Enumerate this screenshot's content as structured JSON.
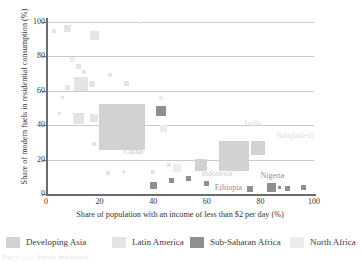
{
  "chart_data": {
    "type": "scatter",
    "title": "",
    "xlabel": "Share of population with an income of less than $2 per day (%)",
    "ylabel": "Share of modern fuels in residential consumption (%)",
    "xlim": [
      0,
      100
    ],
    "ylim": [
      0,
      100
    ],
    "xticks": [
      "0",
      "20",
      "40",
      "60",
      "80",
      "100"
    ],
    "yticks": [
      "0",
      "20",
      "40",
      "60",
      "80",
      "100"
    ],
    "grid": "horizontal",
    "legend_position": "bottom",
    "legend": [
      {
        "name": "Developing Asia",
        "color": "#d2d2d2"
      },
      {
        "name": "Latin America",
        "color": "#e4e4e4"
      },
      {
        "name": "Sub-Saharan Africa",
        "color": "#8f8f8f"
      },
      {
        "name": "North Africa",
        "color": "#ececec"
      }
    ],
    "annotations": [
      {
        "text": "China",
        "x": 29,
        "y": 24,
        "color": "#c8c8c8"
      },
      {
        "text": "India",
        "x": 74,
        "y": 40,
        "color": "#d8d8d8"
      },
      {
        "text": "Bangladesh",
        "x": 86,
        "y": 33,
        "color": "#e0e0e0"
      },
      {
        "text": "Indonesia",
        "x": 58,
        "y": 11,
        "color": "#cdcdcd"
      },
      {
        "text": "Nigeria",
        "x": 80,
        "y": 10,
        "color": "#8f8f8f"
      },
      {
        "text": "Ethiopia",
        "x": 63,
        "y": 3,
        "color": "#8f8f8f"
      }
    ],
    "points": [
      {
        "series": "Developing Asia",
        "x": 28.5,
        "y": 39,
        "size": 46,
        "label": "China"
      },
      {
        "series": "Developing Asia",
        "x": 70,
        "y": 22,
        "size": 30,
        "label": "India"
      },
      {
        "series": "Developing Asia",
        "x": 79,
        "y": 27,
        "size": 14,
        "label": "Bangladesh"
      },
      {
        "series": "Developing Asia",
        "x": 58,
        "y": 17,
        "size": 12,
        "label": "Indonesia"
      },
      {
        "series": "Sub-Saharan Africa",
        "x": 84,
        "y": 4,
        "size": 9,
        "label": "Nigeria"
      },
      {
        "series": "Sub-Saharan Africa",
        "x": 76,
        "y": 3,
        "size": 6,
        "label": "Ethiopia"
      },
      {
        "series": "Sub-Saharan Africa",
        "x": 43,
        "y": 48,
        "size": 10,
        "label": "South Africa"
      },
      {
        "series": "Sub-Saharan Africa",
        "x": 40,
        "y": 5,
        "size": 7,
        "label": ""
      },
      {
        "series": "Sub-Saharan Africa",
        "x": 47,
        "y": 8,
        "size": 5,
        "label": ""
      },
      {
        "series": "Sub-Saharan Africa",
        "x": 53,
        "y": 9,
        "size": 5,
        "label": ""
      },
      {
        "series": "Sub-Saharan Africa",
        "x": 60,
        "y": 6,
        "size": 5,
        "label": ""
      },
      {
        "series": "Sub-Saharan Africa",
        "x": 90,
        "y": 3,
        "size": 5,
        "label": ""
      },
      {
        "series": "Sub-Saharan Africa",
        "x": 96,
        "y": 4,
        "size": 5,
        "label": ""
      },
      {
        "series": "Sub-Saharan Africa",
        "x": 87,
        "y": 4,
        "size": 3,
        "label": ""
      },
      {
        "series": "Latin America",
        "x": 12,
        "y": 44,
        "size": 11,
        "label": ""
      },
      {
        "series": "Latin America",
        "x": 13,
        "y": 64,
        "size": 14,
        "label": ""
      },
      {
        "series": "Latin America",
        "x": 8,
        "y": 96,
        "size": 7,
        "label": ""
      },
      {
        "series": "Latin America",
        "x": 18,
        "y": 92,
        "size": 9,
        "label": ""
      },
      {
        "series": "Latin America",
        "x": 18,
        "y": 44,
        "size": 8,
        "label": ""
      },
      {
        "series": "Latin America",
        "x": 17,
        "y": 64,
        "size": 6,
        "label": ""
      },
      {
        "series": "Latin America",
        "x": 8,
        "y": 62,
        "size": 5,
        "label": ""
      },
      {
        "series": "Latin America",
        "x": 3,
        "y": 95,
        "size": 4,
        "label": ""
      },
      {
        "series": "Latin America",
        "x": 24,
        "y": 69,
        "size": 4,
        "label": ""
      },
      {
        "series": "Latin America",
        "x": 12,
        "y": 74,
        "size": 5,
        "label": ""
      },
      {
        "series": "Latin America",
        "x": 14,
        "y": 71,
        "size": 4,
        "label": ""
      },
      {
        "series": "Latin America",
        "x": 6,
        "y": 56,
        "size": 3,
        "label": ""
      },
      {
        "series": "Latin America",
        "x": 5,
        "y": 47,
        "size": 3,
        "label": ""
      },
      {
        "series": "Latin America",
        "x": 30,
        "y": 64,
        "size": 5,
        "label": ""
      },
      {
        "series": "Latin America",
        "x": 18,
        "y": 29,
        "size": 4,
        "label": ""
      },
      {
        "series": "Latin America",
        "x": 23,
        "y": 12,
        "size": 4,
        "label": ""
      },
      {
        "series": "Latin America",
        "x": 29,
        "y": 13,
        "size": 3,
        "label": ""
      },
      {
        "series": "Latin America",
        "x": 40,
        "y": 13,
        "size": 4,
        "label": ""
      },
      {
        "series": "Latin America",
        "x": 46,
        "y": 17,
        "size": 4,
        "label": ""
      },
      {
        "series": "North Africa",
        "x": 10,
        "y": 78,
        "size": 5,
        "label": ""
      },
      {
        "series": "North Africa",
        "x": 43,
        "y": 56,
        "size": 4,
        "label": ""
      },
      {
        "series": "North Africa",
        "x": 44,
        "y": 38,
        "size": 7,
        "label": ""
      },
      {
        "series": "North Africa",
        "x": 49,
        "y": 15,
        "size": 8,
        "label": ""
      },
      {
        "series": "North Africa",
        "x": 35,
        "y": 100,
        "size": 3,
        "label": ""
      }
    ]
  },
  "caption": {
    "text": "Figure 1.1 — Energy and poverty"
  }
}
